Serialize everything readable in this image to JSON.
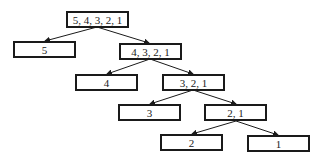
{
  "nodes": [
    {
      "id": "n0",
      "label": "5, 4, 3, 2, 1",
      "x": 66,
      "y": 11
    },
    {
      "id": "n1",
      "label": "5",
      "x": 13,
      "y": 41
    },
    {
      "id": "n2",
      "label": "4, 3, 2, 1",
      "x": 119,
      "y": 43
    },
    {
      "id": "n3",
      "label": "4",
      "x": 75,
      "y": 74
    },
    {
      "id": "n4",
      "label": "3, 2, 1",
      "x": 162,
      "y": 74
    },
    {
      "id": "n5",
      "label": "3",
      "x": 118,
      "y": 104
    },
    {
      "id": "n6",
      "label": "2, 1",
      "x": 204,
      "y": 104
    },
    {
      "id": "n7",
      "label": "2",
      "x": 160,
      "y": 134
    },
    {
      "id": "n8",
      "label": "1",
      "x": 247,
      "y": 135
    }
  ],
  "edges": [
    [
      "n0",
      "n1"
    ],
    [
      "n0",
      "n2"
    ],
    [
      "n2",
      "n3"
    ],
    [
      "n2",
      "n4"
    ],
    [
      "n4",
      "n5"
    ],
    [
      "n4",
      "n6"
    ],
    [
      "n6",
      "n7"
    ],
    [
      "n6",
      "n8"
    ]
  ]
}
